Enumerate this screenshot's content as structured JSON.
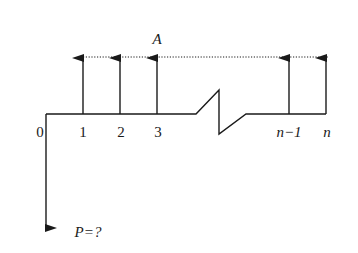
{
  "diagram": {
    "type": "cash-flow-diagram",
    "annuity_label": "A",
    "present_value_label": "P=?",
    "origin_label": "0",
    "periods": [
      {
        "label": "1",
        "x": 83
      },
      {
        "label": "2",
        "x": 120
      },
      {
        "label": "3",
        "x": 157
      },
      {
        "label": "n−1",
        "x": 289
      },
      {
        "label": "n",
        "x": 326
      }
    ],
    "colors": {
      "line": "#1a1a1a",
      "background": "#ffffff"
    }
  }
}
